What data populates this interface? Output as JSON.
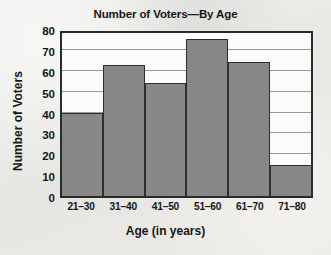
{
  "chart_data": {
    "type": "bar",
    "title": "Number of Voters—By Age",
    "xlabel": "Age (in years)",
    "ylabel": "Number of Voters",
    "categories": [
      "21–30",
      "31–40",
      "41–50",
      "51–60",
      "61–70",
      "71–80"
    ],
    "values": [
      40,
      63,
      54,
      75,
      64,
      15
    ],
    "ylim": [
      0,
      80
    ],
    "yticks": [
      0,
      10,
      20,
      30,
      40,
      50,
      60,
      70,
      80
    ],
    "ytick_labels": [
      "0",
      "10",
      "20",
      "30",
      "40",
      "50",
      "60",
      "70",
      "80"
    ],
    "grid": "horizontal",
    "legend": "none",
    "bar_color": "#878787",
    "bar_edge_color": "#2e2e2e",
    "axis_color": "#2a2a2a",
    "gridline_color": "#9a9a9a",
    "plot_background": "#fbfbfa",
    "page_background": "#e9e9e6",
    "text_color": "#161616"
  }
}
